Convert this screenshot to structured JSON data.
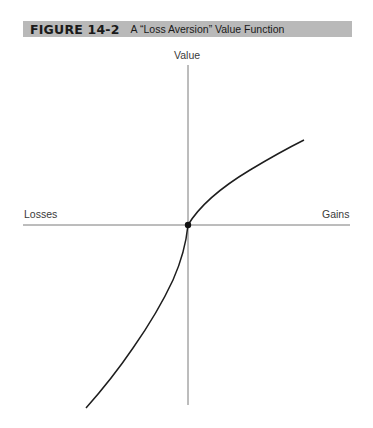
{
  "figure": {
    "number": "FIGURE 14-2",
    "title": "A “Loss Aversion” Value Function",
    "header_bg": "#b9b9b9"
  },
  "axes": {
    "y_label": "Value",
    "x_left_label": "Losses",
    "x_right_label": "Gains",
    "axis_color": "#7a7a7a"
  },
  "curve": {
    "color": "#1e1e1e",
    "description": "Concave for gains, convex and steeper for losses; passes through origin marked by a dot",
    "gains_branch_endpoint": [
      304,
      140
    ],
    "losses_branch_endpoint": [
      86,
      408
    ],
    "origin": [
      188,
      225
    ]
  }
}
